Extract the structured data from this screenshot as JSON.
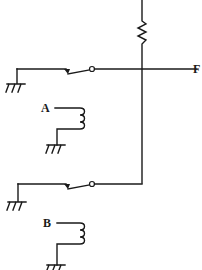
{
  "diagram": {
    "type": "relay-circuit",
    "colors": {
      "line": "#1a1a1a",
      "background": "#ffffff"
    },
    "labels": {
      "output": "F",
      "relay_a": "A",
      "relay_b": "B"
    },
    "components": [
      {
        "id": "resistor",
        "kind": "resistor",
        "orientation": "vertical"
      },
      {
        "id": "switch-a",
        "kind": "relay-contact",
        "controlled_by": "A"
      },
      {
        "id": "switch-b",
        "kind": "relay-contact",
        "controlled_by": "B"
      },
      {
        "id": "coil-a",
        "kind": "relay-coil",
        "label": "A"
      },
      {
        "id": "coil-b",
        "kind": "relay-coil",
        "label": "B"
      },
      {
        "id": "ground-1",
        "kind": "ground"
      },
      {
        "id": "ground-2",
        "kind": "ground"
      },
      {
        "id": "ground-3",
        "kind": "ground"
      },
      {
        "id": "ground-4",
        "kind": "ground"
      }
    ]
  }
}
